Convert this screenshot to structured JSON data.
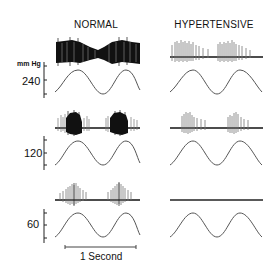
{
  "figure": {
    "columns": [
      {
        "title": "NORMAL"
      },
      {
        "title": "HYPERTENSIVE"
      }
    ],
    "axis": {
      "unit_label": "mm Hg",
      "rows": [
        {
          "pressure_label": "240"
        },
        {
          "pressure_label": "120"
        },
        {
          "pressure_label": "60"
        }
      ]
    },
    "scale_bar": {
      "label": "1 Second"
    },
    "panels": [
      {
        "row": "240",
        "column": "NORMAL",
        "nerve_activity": "dense continuous firing, modulated with pressure wave"
      },
      {
        "row": "240",
        "column": "HYPERTENSIVE",
        "nerve_activity": "grouped bursts on each pressure peak"
      },
      {
        "row": "120",
        "column": "NORMAL",
        "nerve_activity": "dense bursts on each pressure peak"
      },
      {
        "row": "120",
        "column": "HYPERTENSIVE",
        "nerve_activity": "sparse bursts on each pressure peak"
      },
      {
        "row": "60",
        "column": "NORMAL",
        "nerve_activity": "sparse bursts on each pressure peak"
      },
      {
        "row": "60",
        "column": "HYPERTENSIVE",
        "nerve_activity": "no firing (flat baseline)"
      }
    ]
  }
}
